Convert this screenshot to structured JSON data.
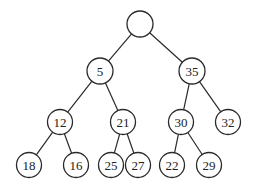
{
  "diagram": {
    "type": "binary-tree",
    "colors": {
      "stroke": "#2a2a2a",
      "fill": "#ffffff",
      "text": "#222222"
    },
    "nodes": [
      {
        "id": "root",
        "label": ""
      },
      {
        "id": "n5",
        "label": "5"
      },
      {
        "id": "n35",
        "label": "35"
      },
      {
        "id": "n12",
        "label": "12"
      },
      {
        "id": "n21",
        "label": "21"
      },
      {
        "id": "n30",
        "label": "30"
      },
      {
        "id": "n32",
        "label": "32"
      },
      {
        "id": "n18",
        "label": "18"
      },
      {
        "id": "n16",
        "label": "16"
      },
      {
        "id": "n25",
        "label": "25"
      },
      {
        "id": "n27",
        "label": "27"
      },
      {
        "id": "n22",
        "label": "22"
      },
      {
        "id": "n29",
        "label": "29"
      }
    ],
    "edges": [
      [
        "root",
        "n5"
      ],
      [
        "root",
        "n35"
      ],
      [
        "n5",
        "n12"
      ],
      [
        "n5",
        "n21"
      ],
      [
        "n35",
        "n30"
      ],
      [
        "n35",
        "n32"
      ],
      [
        "n12",
        "n18"
      ],
      [
        "n12",
        "n16"
      ],
      [
        "n21",
        "n25"
      ],
      [
        "n21",
        "n27"
      ],
      [
        "n30",
        "n22"
      ],
      [
        "n30",
        "n29"
      ]
    ]
  }
}
